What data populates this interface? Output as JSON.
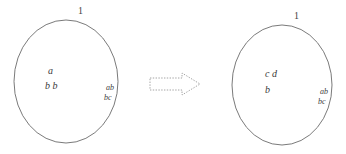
{
  "canvas": {
    "width": 346,
    "height": 154,
    "background": "#ffffff",
    "stroke_color": "#6b6b6b",
    "text_color": "#3a3a3a"
  },
  "diagram": {
    "type": "state-transition-sketch",
    "left_node": {
      "name": "left-ellipse",
      "top_label": "1",
      "inner_labels": [
        "a",
        "b b"
      ],
      "edge_labels": [
        "ab",
        "bc"
      ],
      "shape": "ellipse",
      "cx": 66,
      "cy": 81,
      "rx": 52,
      "ry": 61
    },
    "right_node": {
      "name": "right-ellipse",
      "top_label": "1",
      "inner_labels": [
        "c d",
        "b"
      ],
      "edge_labels": [
        "ab",
        "bc"
      ],
      "shape": "ellipse",
      "cx": 282,
      "cy": 85,
      "rx": 50,
      "ry": 60
    },
    "arrow": {
      "name": "transition-arrow",
      "direction": "right",
      "style": "dashed-outline-block-arrow",
      "x": 150,
      "y": 73,
      "width": 50,
      "height": 22
    }
  }
}
